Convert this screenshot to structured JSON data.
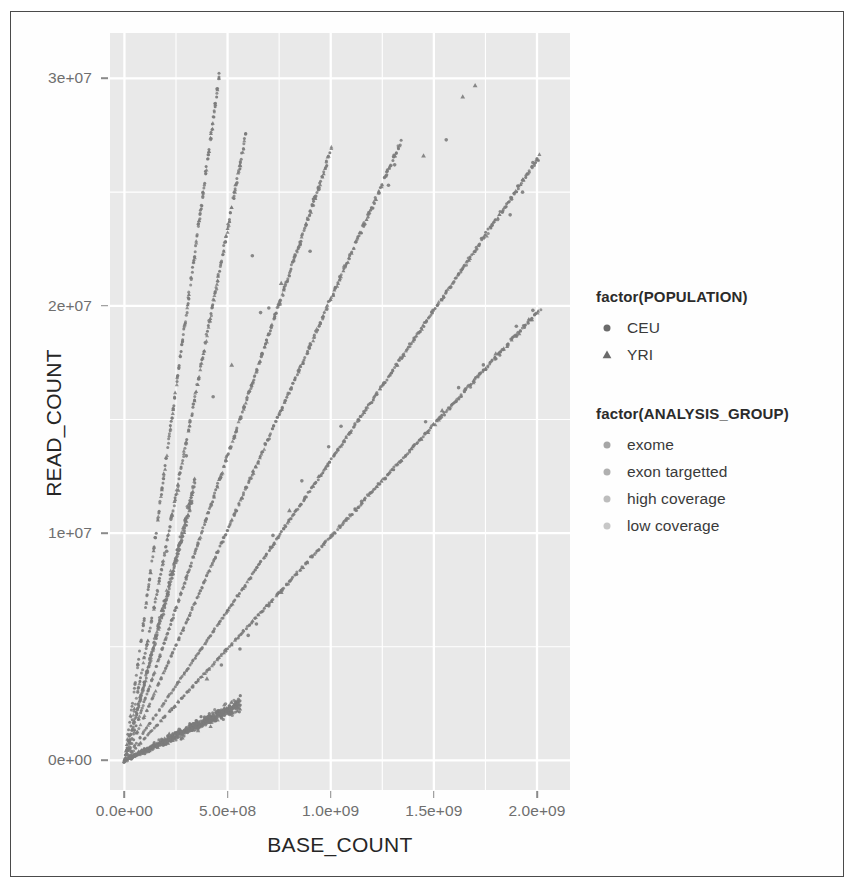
{
  "chart_data": {
    "type": "scatter",
    "title": "",
    "xlabel": "BASE_COUNT",
    "ylabel": "READ_COUNT",
    "xlim": [
      -70000000,
      2160000000
    ],
    "ylim": [
      -1300000,
      32000000
    ],
    "grid": true,
    "panel_background": "#e9e9e9",
    "gridline_color": "#ffffff",
    "point_color": "#7c7c7c",
    "xticks": [
      {
        "value": 0,
        "label": "0.0e+00"
      },
      {
        "value": 500000000,
        "label": "5.0e+08"
      },
      {
        "value": 1000000000,
        "label": "1.0e+09"
      },
      {
        "value": 1500000000,
        "label": "1.5e+09"
      },
      {
        "value": 2000000000,
        "label": "2.0e+09"
      }
    ],
    "yticks": [
      {
        "value": 0,
        "label": "0e+00"
      },
      {
        "value": 10000000,
        "label": "1e+07"
      },
      {
        "value": 20000000,
        "label": "2e+07"
      },
      {
        "value": 30000000,
        "label": "3e+07"
      }
    ],
    "x_minor": [
      250000000,
      750000000,
      1250000000,
      1750000000
    ],
    "y_minor": [
      5000000,
      15000000,
      25000000
    ],
    "legends": [
      {
        "title": "factor(POPULATION)",
        "position": "right",
        "entries": [
          {
            "label": "CEU",
            "shape": "circle",
            "color": "#6b6b6b"
          },
          {
            "label": "YRI",
            "shape": "triangle",
            "color": "#6b6b6b"
          }
        ]
      },
      {
        "title": "factor(ANALYSIS_GROUP)",
        "position": "right",
        "entries": [
          {
            "label": "exome",
            "shape": "circle",
            "color": "#a6a6a6"
          },
          {
            "label": "exon targetted",
            "shape": "circle",
            "color": "#b0b0b0"
          },
          {
            "label": "high coverage",
            "shape": "circle",
            "color": "#bdbdbd"
          },
          {
            "label": "low coverage",
            "shape": "circle",
            "color": "#c7c7c7"
          }
        ]
      }
    ],
    "series": [
      {
        "name": "exome-like steep ray",
        "slope": 0.0655,
        "x_start": 0,
        "x_end": 460000000,
        "n": 210,
        "shape_mix": 0.22,
        "jitter_x": 7000000,
        "jitter_y": 260000,
        "width": 2.6
      },
      {
        "name": "high coverage ray",
        "slope": 0.0468,
        "x_start": 0,
        "x_end": 590000000,
        "n": 230,
        "shape_mix": 0.3,
        "jitter_x": 8000000,
        "jitter_y": 240000,
        "width": 2.6
      },
      {
        "name": "low coverage ray A",
        "slope": 0.0268,
        "x_start": 0,
        "x_end": 1000000000,
        "n": 320,
        "shape_mix": 0.26,
        "jitter_x": 9000000,
        "jitter_y": 170000,
        "width": 2.6
      },
      {
        "name": "low coverage ray B",
        "slope": 0.0203,
        "x_start": 0,
        "x_end": 1340000000,
        "n": 340,
        "shape_mix": 0.24,
        "jitter_x": 10000000,
        "jitter_y": 150000,
        "width": 2.6
      },
      {
        "name": "exon targetted ray",
        "slope": 0.0132,
        "x_start": 0,
        "x_end": 2010000000,
        "n": 420,
        "shape_mix": 0.2,
        "jitter_x": 11000000,
        "jitter_y": 120000,
        "width": 2.6
      },
      {
        "name": "shallow ray",
        "slope": 0.00985,
        "x_start": 0,
        "x_end": 2010000000,
        "n": 380,
        "shape_mix": 0.18,
        "jitter_x": 11000000,
        "jitter_y": 110000,
        "width": 2.6
      },
      {
        "name": "basal band",
        "slope": 0.0044,
        "x_start": 0,
        "x_end": 560000000,
        "n": 520,
        "shape_mix": 0.3,
        "jitter_x": 9000000,
        "jitter_y": 330000,
        "width": 2.8
      },
      {
        "name": "mid cluster fan",
        "slope": 0.0355,
        "x_start": 0,
        "x_end": 340000000,
        "n": 260,
        "shape_mix": 0.28,
        "jitter_x": 7000000,
        "jitter_y": 420000,
        "width": 2.6
      }
    ],
    "outliers": [
      {
        "x": 1700000000,
        "y": 29700000,
        "shape": "triangle"
      },
      {
        "x": 1640000000,
        "y": 29200000,
        "shape": "triangle"
      },
      {
        "x": 1560000000,
        "y": 27300000,
        "shape": "circle"
      },
      {
        "x": 1450000000,
        "y": 26600000,
        "shape": "triangle"
      },
      {
        "x": 1310000000,
        "y": 26200000,
        "shape": "circle"
      },
      {
        "x": 1280000000,
        "y": 25300000,
        "shape": "circle"
      },
      {
        "x": 1980000000,
        "y": 26300000,
        "shape": "circle"
      },
      {
        "x": 1930000000,
        "y": 25000000,
        "shape": "circle"
      },
      {
        "x": 1870000000,
        "y": 24000000,
        "shape": "circle"
      },
      {
        "x": 1980000000,
        "y": 19800000,
        "shape": "circle"
      },
      {
        "x": 1900000000,
        "y": 19100000,
        "shape": "circle"
      },
      {
        "x": 1800000000,
        "y": 17900000,
        "shape": "triangle"
      },
      {
        "x": 1740000000,
        "y": 17400000,
        "shape": "circle"
      },
      {
        "x": 1620000000,
        "y": 16400000,
        "shape": "circle"
      },
      {
        "x": 1540000000,
        "y": 15400000,
        "shape": "triangle"
      },
      {
        "x": 1460000000,
        "y": 14900000,
        "shape": "circle"
      },
      {
        "x": 900000000,
        "y": 22400000,
        "shape": "circle"
      },
      {
        "x": 620000000,
        "y": 22200000,
        "shape": "circle"
      },
      {
        "x": 760000000,
        "y": 21000000,
        "shape": "triangle"
      },
      {
        "x": 700000000,
        "y": 19900000,
        "shape": "circle"
      },
      {
        "x": 660000000,
        "y": 19700000,
        "shape": "circle"
      },
      {
        "x": 520000000,
        "y": 17400000,
        "shape": "triangle"
      },
      {
        "x": 430000000,
        "y": 16000000,
        "shape": "circle"
      },
      {
        "x": 300000000,
        "y": 13400000,
        "shape": "circle"
      },
      {
        "x": 260000000,
        "y": 11900000,
        "shape": "triangle"
      },
      {
        "x": 230000000,
        "y": 10800000,
        "shape": "triangle"
      },
      {
        "x": 205000000,
        "y": 9200000,
        "shape": "circle"
      },
      {
        "x": 1050000000,
        "y": 14700000,
        "shape": "circle"
      },
      {
        "x": 990000000,
        "y": 13800000,
        "shape": "circle"
      },
      {
        "x": 860000000,
        "y": 12300000,
        "shape": "circle"
      },
      {
        "x": 800000000,
        "y": 11000000,
        "shape": "triangle"
      },
      {
        "x": 720000000,
        "y": 9900000,
        "shape": "circle"
      },
      {
        "x": 1150000000,
        "y": 11400000,
        "shape": "circle"
      },
      {
        "x": 640000000,
        "y": 6000000,
        "shape": "circle"
      },
      {
        "x": 600000000,
        "y": 5500000,
        "shape": "circle"
      },
      {
        "x": 560000000,
        "y": 4900000,
        "shape": "circle"
      },
      {
        "x": 700000000,
        "y": 6800000,
        "shape": "circle"
      },
      {
        "x": 760000000,
        "y": 7400000,
        "shape": "triangle"
      },
      {
        "x": 470000000,
        "y": 4200000,
        "shape": "circle"
      },
      {
        "x": 400000000,
        "y": 3600000,
        "shape": "triangle"
      }
    ]
  }
}
